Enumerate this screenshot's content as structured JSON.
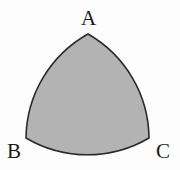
{
  "diagram": {
    "shape": "reuleaux-triangle",
    "fill_color": "#b3b3b3",
    "stroke_color": "#2a2a2a",
    "vertices": [
      {
        "label": "A",
        "x": 88,
        "y": 34
      },
      {
        "label": "B",
        "x": 26,
        "y": 138
      },
      {
        "label": "C",
        "x": 149,
        "y": 138
      }
    ]
  }
}
